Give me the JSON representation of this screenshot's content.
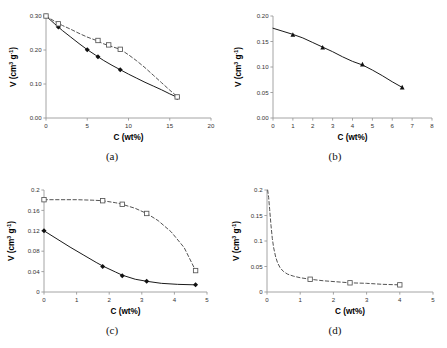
{
  "figure": {
    "background": "#ffffff",
    "axis_color": "#9a9a9a",
    "curve_solid_color": "#1a1a1a",
    "curve_dashed_color": "#4a4a4a",
    "marker_filled_color": "#111111",
    "marker_open_color": "#555555"
  },
  "axis_titles": {
    "x": "C (wt%)",
    "y_main": "V (cm",
    "y_sup1": "3",
    "y_mid": " g",
    "y_sup2": "-1",
    "y_close": ")"
  },
  "captions": {
    "a": "(a)",
    "b": "(b)",
    "c": "(c)",
    "d": "(d)"
  },
  "chart_data": [
    {
      "type": "line",
      "panel": "a",
      "title": "",
      "xlabel": "C (wt%)",
      "ylabel": "V (cm3 g-1)",
      "xlim": [
        0,
        20
      ],
      "ylim": [
        0,
        0.3
      ],
      "xticks": [
        0,
        5,
        10,
        15,
        20
      ],
      "xtick_labels": [
        "0",
        "5",
        "10",
        "15",
        "20"
      ],
      "yticks": [
        0.0,
        0.1,
        0.2,
        0.3
      ],
      "ytick_labels": [
        "0.00",
        "0.10",
        "0.20",
        "0.30"
      ],
      "grid": false,
      "legend": "none",
      "series": [
        {
          "name": "solid-filled-diamond",
          "linestyle": "solid",
          "marker": "filled-diamond",
          "x": [
            0,
            1.5,
            5.0,
            6.3,
            9.0,
            15.9
          ],
          "y": [
            0.3,
            0.268,
            0.201,
            0.18,
            0.142,
            0.06
          ],
          "curve_x": [
            0,
            1,
            2,
            3,
            4,
            5,
            6,
            7,
            8,
            9,
            10,
            11,
            12,
            13,
            14,
            15,
            16
          ],
          "curve_y": [
            0.3,
            0.278,
            0.257,
            0.238,
            0.219,
            0.201,
            0.185,
            0.169,
            0.155,
            0.142,
            0.129,
            0.117,
            0.105,
            0.094,
            0.083,
            0.071,
            0.06
          ]
        },
        {
          "name": "dashed-open-square",
          "linestyle": "dashed",
          "marker": "open-square",
          "x": [
            0,
            1.5,
            6.3,
            7.6,
            9.0,
            15.9
          ],
          "y": [
            0.3,
            0.277,
            0.228,
            0.215,
            0.202,
            0.062
          ],
          "curve_x": [
            0,
            1,
            2,
            3,
            4,
            5,
            6,
            7,
            8,
            9,
            10,
            11,
            12,
            13,
            14,
            15,
            16
          ],
          "curve_y": [
            0.3,
            0.285,
            0.272,
            0.261,
            0.249,
            0.238,
            0.229,
            0.218,
            0.21,
            0.202,
            0.186,
            0.168,
            0.148,
            0.126,
            0.104,
            0.082,
            0.061
          ]
        }
      ]
    },
    {
      "type": "line",
      "panel": "b",
      "title": "",
      "xlabel": "C (wt%)",
      "ylabel": "V (cm3 g-1)",
      "xlim": [
        0,
        8
      ],
      "ylim": [
        0,
        0.2
      ],
      "xticks": [
        0,
        1,
        2,
        3,
        4,
        5,
        6,
        7,
        8
      ],
      "xtick_labels": [
        "0",
        "1",
        "2",
        "3",
        "4",
        "5",
        "6",
        "7",
        "8"
      ],
      "yticks": [
        0.0,
        0.05,
        0.1,
        0.15,
        0.2
      ],
      "ytick_labels": [
        "0.00",
        "0.05",
        "0.10",
        "0.15",
        "0.20"
      ],
      "grid": false,
      "legend": "none",
      "series": [
        {
          "name": "solid-filled-triangle",
          "linestyle": "solid",
          "marker": "filled-triangle",
          "x": [
            1.0,
            2.5,
            4.5,
            6.5
          ],
          "y": [
            0.163,
            0.138,
            0.105,
            0.06
          ],
          "curve_x": [
            0,
            0.5,
            1.0,
            1.5,
            2.0,
            2.5,
            3.0,
            3.5,
            4.0,
            4.5,
            5.0,
            5.5,
            6.0,
            6.5
          ],
          "curve_y": [
            0.176,
            0.17,
            0.164,
            0.157,
            0.148,
            0.139,
            0.13,
            0.12,
            0.111,
            0.104,
            0.094,
            0.083,
            0.071,
            0.06
          ]
        }
      ]
    },
    {
      "type": "line",
      "panel": "c",
      "title": "",
      "xlabel": "C (wt%)",
      "ylabel": "V (cm3 g-1)",
      "xlim": [
        0,
        5
      ],
      "ylim": [
        0,
        0.2
      ],
      "xticks": [
        0,
        1,
        2,
        3,
        4,
        5
      ],
      "xtick_labels": [
        "0",
        "1",
        "2",
        "3",
        "4",
        "5"
      ],
      "yticks": [
        0,
        0.04,
        0.08,
        0.12,
        0.16,
        0.2
      ],
      "ytick_labels": [
        "0",
        "0.04",
        "0.08",
        "0.12",
        "0.16",
        "0.2"
      ],
      "grid": false,
      "legend": "none",
      "series": [
        {
          "name": "dashed-open-square",
          "linestyle": "dashed",
          "marker": "open-square",
          "x": [
            0,
            1.8,
            2.4,
            3.15,
            4.65
          ],
          "y": [
            0.181,
            0.179,
            0.172,
            0.154,
            0.042
          ],
          "curve_x": [
            0,
            0.5,
            1.0,
            1.5,
            1.8,
            2.2,
            2.4,
            2.8,
            3.15,
            3.5,
            3.9,
            4.3,
            4.65
          ],
          "curve_y": [
            0.181,
            0.181,
            0.181,
            0.18,
            0.179,
            0.175,
            0.172,
            0.164,
            0.154,
            0.14,
            0.118,
            0.087,
            0.042
          ]
        },
        {
          "name": "solid-filled-diamond",
          "linestyle": "solid",
          "marker": "filled-diamond",
          "x": [
            0,
            1.8,
            2.4,
            3.15,
            4.65
          ],
          "y": [
            0.12,
            0.05,
            0.032,
            0.021,
            0.014
          ],
          "curve_x": [
            0,
            0.4,
            0.8,
            1.2,
            1.6,
            1.8,
            2.2,
            2.4,
            2.8,
            3.15,
            3.6,
            4.1,
            4.65
          ],
          "curve_y": [
            0.12,
            0.104,
            0.088,
            0.073,
            0.058,
            0.051,
            0.039,
            0.033,
            0.025,
            0.021,
            0.017,
            0.015,
            0.014
          ]
        }
      ]
    },
    {
      "type": "line",
      "panel": "d",
      "title": "",
      "xlabel": "C (wt%)",
      "ylabel": "V (cm3 g-1)",
      "xlim": [
        0,
        5
      ],
      "ylim": [
        0,
        0.2
      ],
      "xticks": [
        0,
        1,
        2,
        3,
        4,
        5
      ],
      "xtick_labels": [
        "0",
        "1",
        "2",
        "3",
        "4",
        "5"
      ],
      "yticks": [
        0,
        0.05,
        0.1,
        0.15,
        0.2
      ],
      "ytick_labels": [
        "0",
        "0.05",
        "0.1",
        "0.15",
        "0.2"
      ],
      "grid": false,
      "legend": "none",
      "series": [
        {
          "name": "dashed-decay-open-square",
          "linestyle": "dashed",
          "marker": "open-square",
          "x": [
            1.3,
            2.5,
            4.0
          ],
          "y": [
            0.025,
            0.018,
            0.014
          ],
          "curve_x": [
            0.02,
            0.05,
            0.08,
            0.12,
            0.16,
            0.2,
            0.26,
            0.32,
            0.4,
            0.5,
            0.62,
            0.8,
            1.0,
            1.3,
            1.7,
            2.1,
            2.5,
            3.0,
            3.5,
            4.0
          ],
          "curve_y": [
            0.2,
            0.185,
            0.162,
            0.131,
            0.105,
            0.087,
            0.069,
            0.057,
            0.047,
            0.04,
            0.035,
            0.031,
            0.028,
            0.025,
            0.022,
            0.02,
            0.018,
            0.017,
            0.015,
            0.014
          ]
        }
      ]
    }
  ]
}
